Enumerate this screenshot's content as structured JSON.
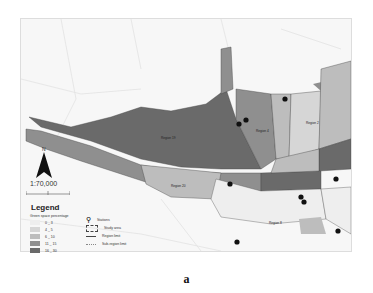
{
  "map": {
    "scale": "1:70,000",
    "north_label": "N",
    "regions": [
      {
        "id": "region-19",
        "label": "Region 19",
        "class": "16_30"
      },
      {
        "id": "region-20",
        "label": "Region 20",
        "class": "6_10"
      },
      {
        "id": "region-4",
        "label": "Region 4",
        "class": "6_10"
      },
      {
        "id": "region-1",
        "label": "Region 1",
        "class": "11_15"
      },
      {
        "id": "region-2",
        "label": "Region 2",
        "class": "6_10"
      },
      {
        "id": "region-3",
        "label": "Region 3",
        "class": "11_15"
      },
      {
        "id": "region-8",
        "label": "Region 8",
        "class": "0_3"
      },
      {
        "id": "region-10",
        "label": "Region 10",
        "class": "0_3"
      },
      {
        "id": "region-11",
        "label": "Region 11",
        "class": "0_3"
      },
      {
        "id": "region-16",
        "label": "Region 16",
        "class": "0_3"
      },
      {
        "id": "region-12",
        "label": "Region 12",
        "class": "0_3"
      }
    ]
  },
  "legend": {
    "title": "Legend",
    "subtitle": "Green space percentage",
    "classes": [
      {
        "label": "0 _ 3",
        "color": "#eeeeee"
      },
      {
        "label": "4 _ 5",
        "color": "#d6d6d6"
      },
      {
        "label": "6 _ 10",
        "color": "#bdbdbd"
      },
      {
        "label": "11 _ 15",
        "color": "#8f8f8f"
      },
      {
        "label": "16 _ 30",
        "color": "#6a6a6a"
      }
    ],
    "symbols": [
      {
        "icon": "map-pin-icon",
        "label": "Stations"
      },
      {
        "icon": "study-area-outline",
        "label": "Study area"
      },
      {
        "icon": "region-limit-line",
        "label": "Region limit"
      },
      {
        "icon": "sub-region-limit-line",
        "label": "Sub-region limit"
      }
    ]
  },
  "caption": "a"
}
